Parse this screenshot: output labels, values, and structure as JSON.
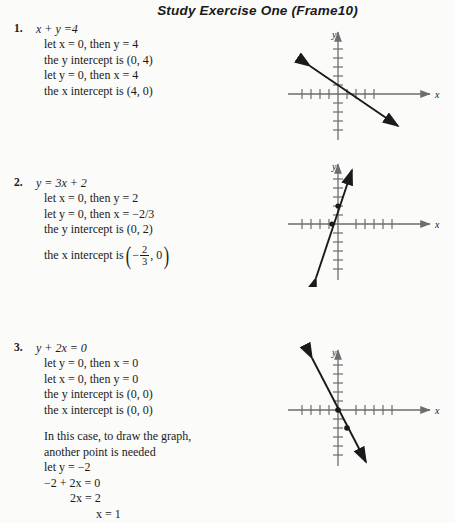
{
  "header": {
    "title": "Study Exercise One (Frame10)"
  },
  "problems": [
    {
      "number": "1.",
      "equation": "x + y =4",
      "lines": [
        "let x = 0, then y = 4",
        "the y intercept is (0, 4)",
        "let y = 0, then x = 4",
        "the x intercept is (4, 0)"
      ]
    },
    {
      "number": "2.",
      "equation": "y = 3x + 2",
      "lines": [
        "let x = 0, then y = 2",
        "let y = 0, then x = −2/3",
        "the y intercept is (0, 2)"
      ],
      "fraction_line": {
        "prefix": "the x intercept is",
        "sign": "−",
        "numerator": "2",
        "denominator": "3",
        "second": ", 0"
      }
    },
    {
      "number": "3.",
      "equation": "y + 2x = 0",
      "lines": [
        "let y = 0, then x = 0",
        "let x = 0, then y = 0",
        "the y intercept is (0, 0)",
        "the x intercept is (0, 0)"
      ],
      "paragraph": [
        "In this case, to draw the graph,",
        "another point is needed",
        "let y = −2",
        "−2 + 2x = 0",
        "2x = 2",
        "x = 1"
      ]
    }
  ],
  "graphs": [
    {
      "name": "graph-problem-1",
      "x_axis_label": "x",
      "y_axis_label": "y",
      "points": [],
      "line": {
        "slope": -1,
        "intercept": 4
      }
    },
    {
      "name": "graph-problem-2",
      "x_axis_label": "x",
      "y_axis_label": "y",
      "points": [
        [
          0,
          2
        ],
        [
          -0.667,
          0
        ]
      ],
      "line": {
        "slope": 3,
        "intercept": 2
      }
    },
    {
      "name": "graph-problem-3",
      "x_axis_label": "x",
      "y_axis_label": "y",
      "points": [
        [
          0,
          0
        ],
        [
          1,
          -2
        ]
      ],
      "line": {
        "slope": -2,
        "intercept": 0
      }
    }
  ],
  "style": {
    "ink": "#1a1a1a",
    "axis": "#6d6d6d",
    "paper": "#fbfbf9"
  }
}
